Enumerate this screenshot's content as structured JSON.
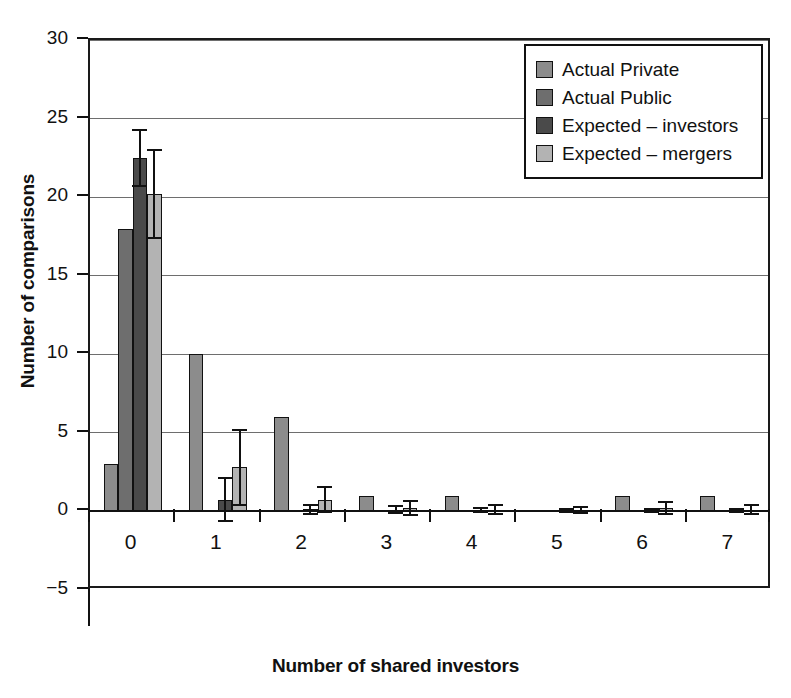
{
  "chart_data": {
    "type": "bar",
    "title": "",
    "xlabel": "Number of shared investors",
    "ylabel": "Number of comparisons",
    "categories": [
      "0",
      "1",
      "2",
      "3",
      "4",
      "5",
      "6",
      "7"
    ],
    "ylim": [
      -5,
      30
    ],
    "yticks": [
      -5,
      0,
      5,
      10,
      15,
      20,
      25,
      30
    ],
    "ytick_labels": [
      "−5",
      "0",
      "5",
      "10",
      "15",
      "20",
      "25",
      "30"
    ],
    "grid": "horizontal",
    "legend_position": "top-right",
    "series": [
      {
        "name": "Actual Private",
        "color": "#8c8c8c",
        "values": [
          3,
          10,
          6,
          1,
          1,
          0,
          1,
          1
        ],
        "errors": [
          null,
          null,
          null,
          null,
          null,
          null,
          null,
          null
        ]
      },
      {
        "name": "Actual Public",
        "color": "#6e6e6e",
        "values": [
          18,
          0,
          0,
          0,
          0,
          0,
          0,
          0
        ],
        "errors": [
          null,
          null,
          null,
          null,
          null,
          null,
          null,
          null
        ]
      },
      {
        "name": "Expected – investors",
        "color": "#4a4a4a",
        "values": [
          22.5,
          0.75,
          0.15,
          0.12,
          0.08,
          0.05,
          0.05,
          0.05
        ],
        "errors": [
          1.85,
          1.45,
          0.35,
          0.3,
          0.2,
          0.15,
          0.18,
          0.15
        ]
      },
      {
        "name": "Expected – mergers",
        "color": "#b3b3b3",
        "values": [
          20.2,
          2.8,
          0.75,
          0.22,
          0.12,
          0.08,
          0.22,
          0.1
        ],
        "errors": [
          2.85,
          2.45,
          0.85,
          0.5,
          0.35,
          0.25,
          0.42,
          0.35
        ]
      }
    ]
  },
  "legend": {
    "items": [
      {
        "label": "Actual Private"
      },
      {
        "label": "Actual Public"
      },
      {
        "label": "Expected – investors"
      },
      {
        "label": "Expected – mergers"
      }
    ]
  },
  "axes": {
    "y_title": "Number of comparisons",
    "x_title": "Number of shared investors"
  }
}
